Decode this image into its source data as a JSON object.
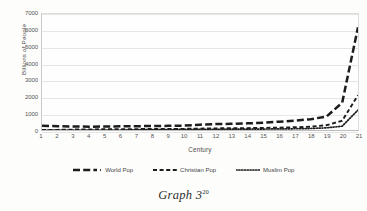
{
  "caption": {
    "text": "Graph 3",
    "footnote": "20"
  },
  "chart_data": {
    "type": "line",
    "title": "",
    "xlabel": "Century",
    "ylabel": "Billions of People",
    "xlim": [
      1,
      21
    ],
    "ylim": [
      0,
      7000
    ],
    "yticks": [
      7000,
      6000,
      5000,
      4000,
      3000,
      2000,
      1000,
      0
    ],
    "xticks": [
      1,
      2,
      3,
      4,
      5,
      6,
      7,
      8,
      9,
      10,
      11,
      12,
      13,
      14,
      15,
      16,
      17,
      18,
      19,
      20,
      21
    ],
    "grid": true,
    "legend_position": "bottom",
    "x": [
      1,
      2,
      3,
      4,
      5,
      6,
      7,
      8,
      9,
      10,
      11,
      12,
      13,
      14,
      15,
      16,
      17,
      18,
      19,
      20,
      21
    ],
    "series": [
      {
        "name": "World Pop",
        "style": "long-dash",
        "color": "#1c1c1c",
        "values": [
          250,
          230,
          210,
          200,
          210,
          220,
          230,
          240,
          250,
          265,
          320,
          360,
          370,
          400,
          440,
          500,
          560,
          650,
          810,
          1650,
          6200
        ]
      },
      {
        "name": "Christian Pop",
        "style": "dash",
        "color": "#1c1c1c",
        "values": [
          1,
          10,
          25,
          35,
          45,
          50,
          55,
          60,
          65,
          70,
          85,
          100,
          105,
          115,
          125,
          145,
          165,
          195,
          290,
          560,
          2100
        ]
      },
      {
        "name": "Muslim Pop",
        "style": "dot",
        "color": "#1c1c1c",
        "values": [
          0,
          0,
          0,
          0,
          0,
          0,
          15,
          25,
          30,
          35,
          40,
          45,
          48,
          52,
          58,
          65,
          75,
          90,
          130,
          230,
          1200
        ]
      }
    ]
  },
  "legend": [
    {
      "label": "World Pop",
      "marker": "long-dash-line-icon"
    },
    {
      "label": "Christian Pop",
      "marker": "dash-line-icon"
    },
    {
      "label": "Muslim Pop",
      "marker": "dotted-line-icon"
    }
  ]
}
